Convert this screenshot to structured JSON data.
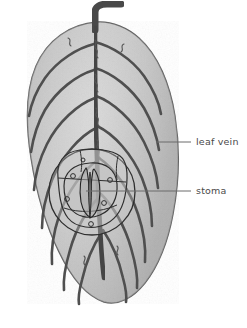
{
  "figure": {
    "kind": "botanical-diagram",
    "subject": "leaf",
    "style": "pencil-and-ink grayscale drawing",
    "background_color": "#ffffff"
  },
  "labels": [
    {
      "id": "leaf-vein",
      "text": "leaf vein",
      "color": "#4a4a4a",
      "text_x": 196,
      "text_y": 136,
      "leader": {
        "x1": 191,
        "y1": 142,
        "x2": 156,
        "y2": 142
      }
    },
    {
      "id": "stoma",
      "text": "stoma",
      "color": "#4a4a4a",
      "text_x": 196,
      "text_y": 185,
      "leader": {
        "x1": 191,
        "y1": 191,
        "x2": 86,
        "y2": 191
      }
    }
  ],
  "colors": {
    "background": "#ffffff",
    "blade_light": "#d2d2d2",
    "blade_mid": "#c0c0c0",
    "blade_shadow": "#ababab",
    "outline": "#5c5c5c",
    "vein_dark": "#4f4f4f",
    "midrib": "#454545",
    "petiole": "#4a4a4a",
    "inset_line": "#2f2f2f",
    "label_text": "#4a4a4a",
    "leader_line": "#6b6b6b"
  },
  "leaf": {
    "name": "leaf-blade",
    "outline_path": "M97,22 C70,24 47,40 36,66 C25,92 26,126 31,158 C36,190 45,224 59,252 C71,277 86,296 104,302 C118,306 133,298 145,283 C159,265 168,241 173,214 C179,183 180,148 175,116 C170,84 158,55 139,38 C128,28 112,21 97,22 Z",
    "petiole": {
      "name": "petiole-stem",
      "path": "M95,30 L95,12 C95,7 100,4 107,4 L121,4"
    },
    "midrib": {
      "name": "midrib-vein",
      "path": "M95,28 C95,60 95,96 96,128 C97,160 98,196 100,226 C101,246 102,264 104,278"
    },
    "lateral_veins_left": [
      "M94,44 C78,48 58,60 45,78 C36,91 31,104 29,116",
      "M94,70 C77,75 57,90 45,110 C37,124 33,139 31,152",
      "M95,98 C78,104 58,122 47,144 C39,160 35,176 34,190",
      "M96,128 C80,136 62,156 52,180 C45,198 42,214 42,228",
      "M98,160 C83,170 67,192 59,216 C53,234 51,250 52,264",
      "M100,196 C88,208 76,228 70,250 C65,267 63,280 64,290",
      "M102,232 C94,244 86,262 82,280 C79,291 78,298 79,304"
    ],
    "lateral_veins_right": [
      "M95,42 C111,46 131,58 144,76 C153,89 159,102 161,114",
      "M95,68 C112,73 132,88 144,108 C152,122 157,137 159,150",
      "M96,96 C113,102 133,120 144,142 C152,158 157,174 158,188",
      "M97,126 C114,134 132,154 142,178 C149,196 152,212 152,226",
      "M99,158 C114,168 130,190 138,214 C144,232 146,248 145,262",
      "M101,194 C113,206 125,226 131,248 C136,265 138,278 137,288",
      "M103,230 C111,242 119,260 123,278 C126,289 127,296 126,302"
    ],
    "tertiary_squiggles": [
      "M95,40 c4,3 -3,6 1,9 c4,3 -2,6 2,9",
      "M95,74 c4,3 -3,6 1,9 c4,3 -2,6 2,9",
      "M96,108 c4,3 -3,6 1,9 c4,3 -2,6 2,9",
      "M97,140 c4,3 -3,6 1,9 c4,3 -2,6 2,9",
      "M68,38 c5,2 -1,6 3,8",
      "M124,44 c-5,2 1,6 -3,8",
      "M117,246 c4,3 -3,6 1,9",
      "M84,256 c4,3 -3,6 1,9"
    ]
  },
  "stoma_inset": {
    "name": "stoma-magnified-inset",
    "outer_circle": {
      "cx": 92,
      "cy": 192,
      "r": 43
    },
    "cell_outline_path": "M58,178 C56,162 64,152 80,150 C96,148 112,150 120,156 C128,162 128,176 126,190 C124,206 118,218 106,224 C94,230 76,228 68,218 C60,208 59,192 58,178 Z",
    "inner_cell_path": "M64,186 C64,172 74,164 90,163 C106,162 116,170 117,184 C118,198 112,210 100,215 C88,220 76,216 70,208 C65,201 64,193 64,186 Z",
    "guard_cells": {
      "name": "guard-cell-pair",
      "left_cell": "M86,168 C80,176 79,190 81,202 C83,211 87,216 90,217 C90,205 89,182 87,170 Z",
      "right_cell": "M94,169 C100,177 101,191 99,203 C97,212 93,217 90,218 C90,206 91,182 93,170 Z",
      "pore": "M90,172 C88,182 88,200 90,214 C92,200 92,182 90,172 Z"
    },
    "epidermal_dots": [
      {
        "cx": 73,
        "cy": 176,
        "r": 2.4
      },
      {
        "cx": 110,
        "cy": 180,
        "r": 2.4
      },
      {
        "cx": 67,
        "cy": 199,
        "r": 2.4
      },
      {
        "cx": 104,
        "cy": 203,
        "r": 2.4
      },
      {
        "cx": 91,
        "cy": 224,
        "r": 2.4
      },
      {
        "cx": 83,
        "cy": 160,
        "r": 2.0
      }
    ],
    "detail_strokes": [
      "M58,178 L126,182",
      "M64,208 C78,213 100,213 117,205",
      "M80,150 C82,160 82,166 81,172",
      "M118,156 C116,166 116,172 117,180"
    ]
  }
}
